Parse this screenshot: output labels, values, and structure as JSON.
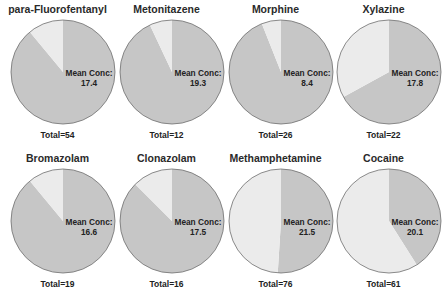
{
  "colors": {
    "dark": "#c6c6c6",
    "light": "#ebebeb",
    "stroke": "#6e6e6e"
  },
  "label_prefix": "Mean Conc:",
  "panels": [
    {
      "title": "para-Fluorofentanyl",
      "mean_conc": "17.4",
      "total": "Total=54"
    },
    {
      "title": "Metonitazene",
      "mean_conc": "19.3",
      "total": "Total=12"
    },
    {
      "title": "Morphine",
      "mean_conc": "8.4",
      "total": "Total=26"
    },
    {
      "title": "Xylazine",
      "mean_conc": "17.8",
      "total": "Total=22"
    },
    {
      "title": "Bromazolam",
      "mean_conc": "16.6",
      "total": "Total=19"
    },
    {
      "title": "Clonazolam",
      "mean_conc": "17.5",
      "total": "Total=16"
    },
    {
      "title": "Methamphetamine",
      "mean_conc": "21.5",
      "total": "Total=76"
    },
    {
      "title": "Cocaine",
      "mean_conc": "20.1",
      "total": "Total=61"
    }
  ],
  "chart_data": {
    "type": "pie",
    "layout": {
      "rows": 2,
      "cols": 4
    },
    "slice_legend": [
      "dark wedge (majority for most drugs)",
      "light wedge"
    ],
    "charts": [
      {
        "title": "para-Fluorofentanyl",
        "total": 54,
        "mean_conc": 17.4,
        "slices": [
          {
            "name": "dark",
            "fraction": 0.89
          },
          {
            "name": "light",
            "fraction": 0.11
          }
        ]
      },
      {
        "title": "Metonitazene",
        "total": 12,
        "mean_conc": 19.3,
        "slices": [
          {
            "name": "dark",
            "fraction": 0.93
          },
          {
            "name": "light",
            "fraction": 0.07
          }
        ]
      },
      {
        "title": "Morphine",
        "total": 26,
        "mean_conc": 8.4,
        "slices": [
          {
            "name": "dark",
            "fraction": 0.94
          },
          {
            "name": "light",
            "fraction": 0.06
          }
        ]
      },
      {
        "title": "Xylazine",
        "total": 22,
        "mean_conc": 17.8,
        "slices": [
          {
            "name": "dark",
            "fraction": 0.67
          },
          {
            "name": "light",
            "fraction": 0.33
          }
        ]
      },
      {
        "title": "Bromazolam",
        "total": 19,
        "mean_conc": 16.6,
        "slices": [
          {
            "name": "dark",
            "fraction": 0.89
          },
          {
            "name": "light",
            "fraction": 0.11
          }
        ]
      },
      {
        "title": "Clonazolam",
        "total": 16,
        "mean_conc": 17.5,
        "slices": [
          {
            "name": "dark",
            "fraction": 0.875
          },
          {
            "name": "light",
            "fraction": 0.125
          }
        ]
      },
      {
        "title": "Methamphetamine",
        "total": 76,
        "mean_conc": 21.5,
        "slices": [
          {
            "name": "dark",
            "fraction": 0.51
          },
          {
            "name": "light",
            "fraction": 0.49
          }
        ]
      },
      {
        "title": "Cocaine",
        "total": 61,
        "mean_conc": 20.1,
        "slices": [
          {
            "name": "dark",
            "fraction": 0.41
          },
          {
            "name": "light",
            "fraction": 0.59
          }
        ]
      }
    ]
  }
}
